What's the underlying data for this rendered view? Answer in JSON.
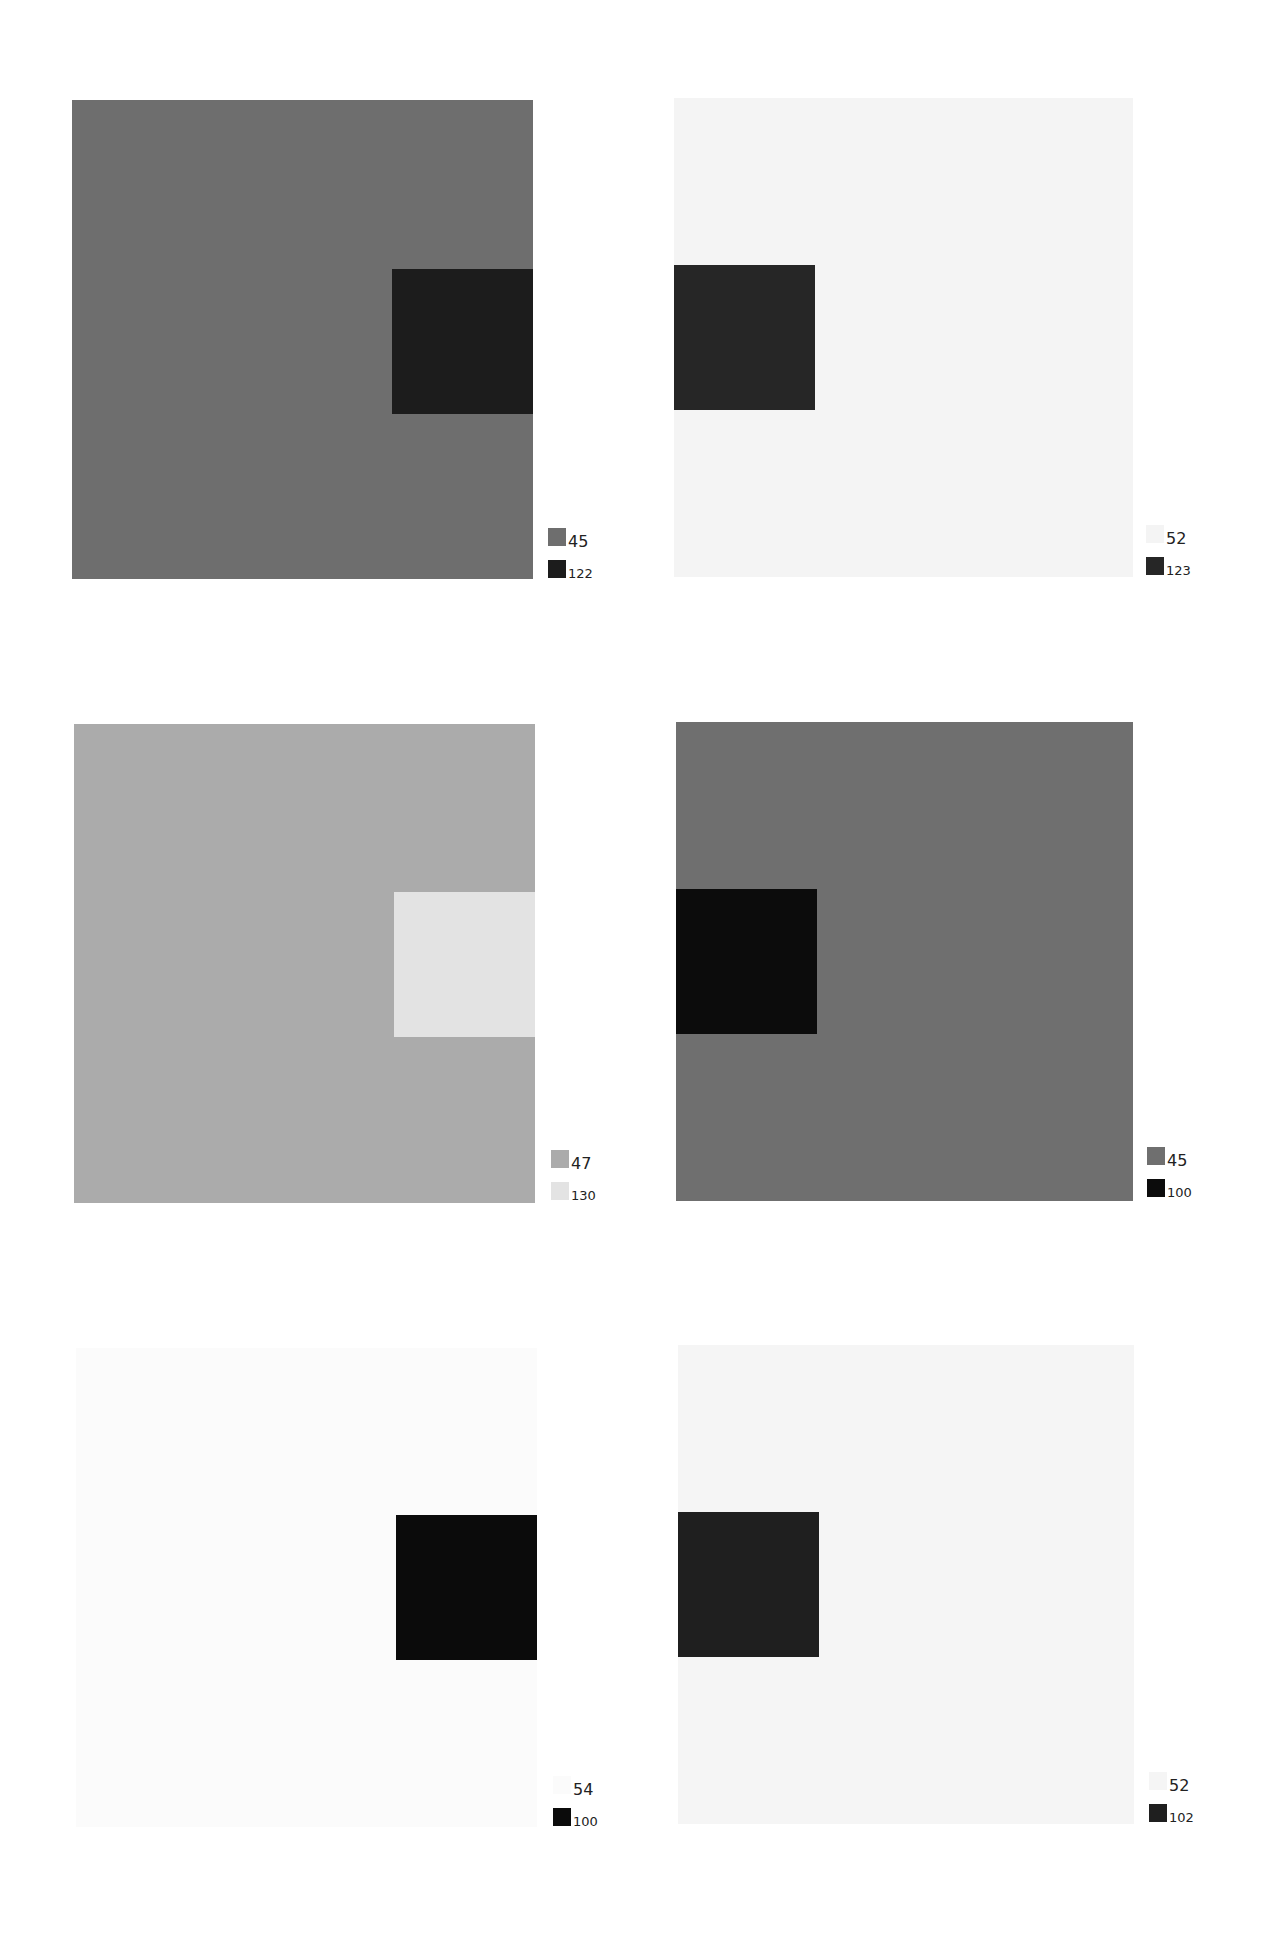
{
  "panels": [
    {
      "id": "p1",
      "bg": "#6e6e6e",
      "inner": "#1c1c1c",
      "inner_side": "right",
      "legend": [
        {
          "label": "45",
          "color": "#6e6e6e"
        },
        {
          "label": "122",
          "color": "#1c1c1c"
        }
      ]
    },
    {
      "id": "p2",
      "bg": "#f4f4f4",
      "inner": "#262626",
      "inner_side": "left",
      "legend": [
        {
          "label": "52",
          "color": "#f4f4f4"
        },
        {
          "label": "123",
          "color": "#262626"
        }
      ]
    },
    {
      "id": "p3",
      "bg": "#ababab",
      "inner": "#e3e3e3",
      "inner_side": "right",
      "legend": [
        {
          "label": "47",
          "color": "#ababab"
        },
        {
          "label": "130",
          "color": "#e3e3e3"
        }
      ]
    },
    {
      "id": "p4",
      "bg": "#6f6f6f",
      "inner": "#0c0c0c",
      "inner_side": "left",
      "legend": [
        {
          "label": "45",
          "color": "#6f6f6f"
        },
        {
          "label": "100",
          "color": "#0c0c0c"
        }
      ]
    },
    {
      "id": "p5",
      "bg": "#fbfbfb",
      "inner": "#0b0b0b",
      "inner_side": "right",
      "legend": [
        {
          "label": "54",
          "color": "#fbfbfb"
        },
        {
          "label": "100",
          "color": "#0b0b0b"
        }
      ]
    },
    {
      "id": "p6",
      "bg": "#f5f5f5",
      "inner": "#1f1f1f",
      "inner_side": "left",
      "legend": [
        {
          "label": "52",
          "color": "#f5f5f5"
        },
        {
          "label": "102",
          "color": "#1f1f1f"
        }
      ]
    }
  ]
}
